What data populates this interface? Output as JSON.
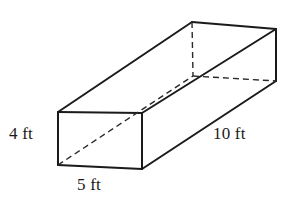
{
  "figure": {
    "name": "rectangular-prism",
    "shape_type": "rectangular prism",
    "unit": "ft",
    "stroke_color": "#1a1a1a",
    "background_color": "#ffffff",
    "solid_stroke_width": 2,
    "dashed_stroke_width": 1.4,
    "dash_pattern": "6 4"
  },
  "labels": {
    "height": "4 ft",
    "width": "5 ft",
    "length": "10 ft"
  },
  "dimensions": {
    "height_value": 4,
    "width_value": 5,
    "length_value": 10,
    "unit": "ft"
  },
  "geometry": {
    "vertices": {
      "front_top_left": [
        58,
        112
      ],
      "front_top_right": [
        142,
        113
      ],
      "front_bottom_left": [
        58,
        165
      ],
      "front_bottom_right": [
        142,
        169
      ],
      "back_top_left": [
        192,
        22
      ],
      "back_top_right": [
        276,
        29
      ],
      "back_bottom_left": [
        193,
        76
      ],
      "back_bottom_right": [
        276,
        81
      ]
    },
    "solid_edges": [
      [
        "front_top_left",
        "front_top_right"
      ],
      [
        "front_top_right",
        "front_bottom_right"
      ],
      [
        "front_bottom_right",
        "front_bottom_left"
      ],
      [
        "front_bottom_left",
        "front_top_left"
      ],
      [
        "front_top_left",
        "back_top_left"
      ],
      [
        "front_top_right",
        "back_top_right"
      ],
      [
        "front_bottom_right",
        "back_bottom_right"
      ],
      [
        "back_top_left",
        "back_top_right"
      ],
      [
        "back_top_right",
        "back_bottom_right"
      ]
    ],
    "dashed_edges": [
      [
        "back_top_left",
        "back_bottom_left"
      ],
      [
        "back_bottom_left",
        "back_bottom_right"
      ],
      [
        "front_bottom_left",
        "back_bottom_left"
      ]
    ]
  }
}
